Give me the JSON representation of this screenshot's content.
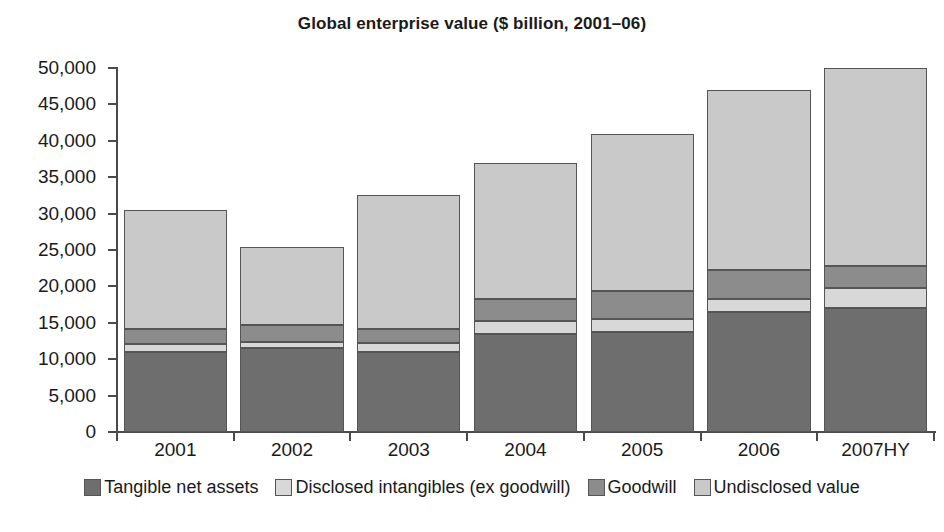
{
  "chart_data": {
    "type": "bar",
    "stacked": true,
    "title": "Global enterprise value ($ billion, 2001–06)",
    "xlabel": "",
    "ylabel": "",
    "ylim": [
      0,
      50000
    ],
    "ytick_step": 5000,
    "ytick_labels": [
      "0",
      "5,000",
      "10,000",
      "15,000",
      "20,000",
      "25,000",
      "30,000",
      "35,000",
      "40,000",
      "45,000",
      "50,000"
    ],
    "ytick_values": [
      0,
      5000,
      10000,
      15000,
      20000,
      25000,
      30000,
      35000,
      40000,
      45000,
      50000
    ],
    "grid": false,
    "legend_position": "bottom",
    "categories": [
      "2001",
      "2002",
      "2003",
      "2004",
      "2005",
      "2006",
      "2007HY"
    ],
    "series": [
      {
        "name": "Tangible net assets",
        "color": "#6e6e6e",
        "values": [
          11000,
          11500,
          11000,
          13500,
          13800,
          16500,
          17000
        ]
      },
      {
        "name": "Disclosed intangibles (ex goodwill)",
        "color": "#d8d8d8",
        "values": [
          1100,
          900,
          1200,
          1800,
          1700,
          1800,
          2800
        ]
      },
      {
        "name": "Goodwill",
        "color": "#8c8c8c",
        "values": [
          2000,
          2300,
          2000,
          3000,
          3800,
          4000,
          3000
        ]
      },
      {
        "name": "Undisclosed value",
        "color": "#c9c9c9",
        "values": [
          16400,
          10700,
          18300,
          18700,
          21700,
          24700,
          27200
        ]
      }
    ],
    "totals": [
      30500,
      25400,
      32500,
      37000,
      41000,
      47000,
      50000
    ]
  },
  "colors": {
    "axis": "#4a4a4a",
    "bar_border": "#555555",
    "text": "#1a1a1a",
    "background": "#ffffff"
  }
}
